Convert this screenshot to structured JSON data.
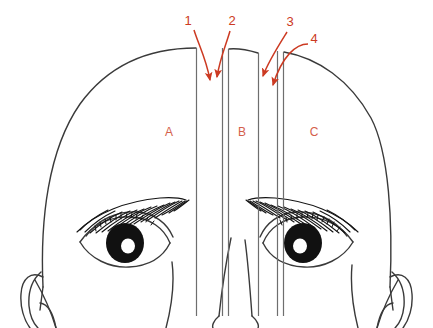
{
  "figure": {
    "colors": {
      "outline": "#3a3a3a",
      "strip_line": "#6e6e6e",
      "annotation": "#cc3a22",
      "region_label": "#d4604a",
      "background": "#ffffff"
    },
    "annotations": [
      {
        "id": "anno-1",
        "label": "1",
        "x": 192,
        "y": 20,
        "arrow_tip_x": 211,
        "arrow_tip_y": 86
      },
      {
        "id": "anno-2",
        "label": "2",
        "x": 231,
        "y": 20,
        "arrow_tip_x": 217,
        "arrow_tip_y": 83
      },
      {
        "id": "anno-3",
        "label": "3",
        "x": 289,
        "y": 20,
        "arrow_tip_x": 263,
        "arrow_tip_y": 82
      },
      {
        "id": "anno-4",
        "label": "4",
        "x": 313,
        "y": 42,
        "arrow_tip_x": 272,
        "arrow_tip_y": 91
      }
    ],
    "regions": [
      {
        "id": "region-a",
        "label": "A",
        "x": 169,
        "y": 132
      },
      {
        "id": "region-b",
        "label": "B",
        "x": 241,
        "y": 132
      },
      {
        "id": "region-c",
        "label": "C",
        "x": 313,
        "y": 132
      }
    ],
    "strips": [
      {
        "id": "strip-line-1",
        "x": 196.5,
        "y_top": 48,
        "y_bottom": 316
      },
      {
        "id": "strip-line-2",
        "x": 222.5,
        "y_top": 48,
        "y_bottom": 316
      },
      {
        "id": "strip-line-3",
        "x": 228.5,
        "y_top": 48,
        "y_bottom": 316
      },
      {
        "id": "strip-line-4",
        "x": 258.5,
        "y_top": 48,
        "y_bottom": 316
      },
      {
        "id": "strip-line-5",
        "x": 277.5,
        "y_top": 48,
        "y_bottom": 316
      },
      {
        "id": "strip-line-6",
        "x": 283.5,
        "y_top": 48,
        "y_bottom": 316
      }
    ]
  }
}
